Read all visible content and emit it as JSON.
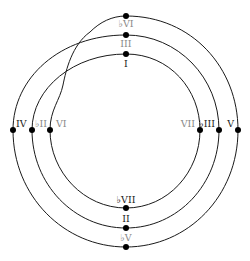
{
  "diagram": {
    "type": "chord-progression-spiral",
    "colors": {
      "line": "#1a1a1a",
      "dot": "#000000",
      "label_dark": "#1a1a1a",
      "label_light": "#888888"
    },
    "nodes": [
      {
        "id": "bVI",
        "label": "♭VI",
        "x": 126,
        "y": 16,
        "tone": "light",
        "lx": 126,
        "ly": 27,
        "anchor": "middle"
      },
      {
        "id": "III",
        "label": "III",
        "x": 126,
        "y": 35,
        "tone": "light",
        "lx": 126,
        "ly": 47,
        "anchor": "middle"
      },
      {
        "id": "I",
        "label": "I",
        "x": 126,
        "y": 54,
        "tone": "dark",
        "lx": 126,
        "ly": 67,
        "anchor": "middle"
      },
      {
        "id": "IV",
        "label": "IV",
        "x": 13,
        "y": 130,
        "tone": "dark",
        "lx": 16,
        "ly": 127,
        "anchor": "start"
      },
      {
        "id": "bII",
        "label": "♭II",
        "x": 32,
        "y": 130,
        "tone": "light",
        "lx": 35,
        "ly": 127,
        "anchor": "start"
      },
      {
        "id": "VI",
        "label": "VI",
        "x": 50,
        "y": 130,
        "tone": "light",
        "lx": 56,
        "ly": 127,
        "anchor": "start"
      },
      {
        "id": "VII",
        "label": "VII",
        "x": 200,
        "y": 130,
        "tone": "light",
        "lx": 195,
        "ly": 127,
        "anchor": "end"
      },
      {
        "id": "bIII",
        "label": "♭III",
        "x": 219,
        "y": 130,
        "tone": "dark",
        "lx": 215,
        "ly": 127,
        "anchor": "end"
      },
      {
        "id": "V",
        "label": "V",
        "x": 238,
        "y": 130,
        "tone": "dark",
        "lx": 234,
        "ly": 127,
        "anchor": "end"
      },
      {
        "id": "bVII",
        "label": "♭VII",
        "x": 126,
        "y": 208,
        "tone": "dark",
        "lx": 126,
        "ly": 203,
        "anchor": "middle"
      },
      {
        "id": "II",
        "label": "II",
        "x": 126,
        "y": 228,
        "tone": "dark",
        "lx": 126,
        "ly": 222,
        "anchor": "middle"
      },
      {
        "id": "bV",
        "label": "♭V",
        "x": 126,
        "y": 247,
        "tone": "light",
        "lx": 126,
        "ly": 241,
        "anchor": "middle"
      }
    ]
  }
}
